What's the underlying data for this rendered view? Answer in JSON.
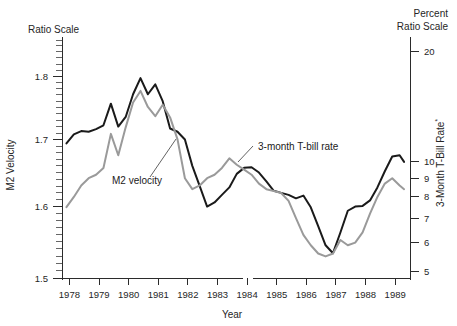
{
  "figure": {
    "top_left_label": "Ratio Scale",
    "top_right_label_line1": "Percent",
    "top_right_label_line2": "Ratio Scale",
    "left_axis_title": "M2 Velocity",
    "right_axis_title": "3-Month T-Bill Rate",
    "right_axis_title_footnote": "*",
    "x_axis_title": "Year",
    "colors": {
      "m2_velocity": "#1a1a1a",
      "tbill_rate": "#9a9a9a",
      "axis": "#2b2b2b",
      "background": "#ffffff"
    }
  },
  "annotations": [
    {
      "label": "M2 velocity",
      "x": 112,
      "y": 184
    },
    {
      "label": "3-month T-bill rate",
      "x": 258,
      "y": 150
    }
  ],
  "chart_data": {
    "type": "line",
    "title": "",
    "subtitle": "",
    "xlabel": "Year",
    "ylabel": "M2 Velocity",
    "y2label": "3-Month T-Bill Rate",
    "grid": false,
    "legend": "inline-annotations",
    "xlim": [
      1977.75,
      1989.5
    ],
    "ylim": [
      1.5,
      1.86
    ],
    "y2lim": [
      4.8,
      21.5
    ],
    "yscale": "log-ratio",
    "y2scale": "log-ratio",
    "xticks": [
      1978,
      1979,
      1980,
      1981,
      1982,
      1983,
      1984,
      1985,
      1986,
      1987,
      1988,
      1989
    ],
    "xticklabels": [
      "1978",
      "1979",
      "1980",
      "1981",
      "1982",
      "1983",
      "1984",
      "1985",
      "1986",
      "1987",
      "1988",
      "1989"
    ],
    "yticks": [
      1.5,
      1.6,
      1.7,
      1.8
    ],
    "yticklabels": [
      "1.5",
      "1.6",
      "1.7",
      "1.8"
    ],
    "y2ticks": [
      5,
      6,
      7,
      8,
      9,
      10,
      20
    ],
    "y2ticklabels": [
      "5",
      "6",
      "7",
      "8",
      "9",
      "10",
      "20"
    ],
    "series": [
      {
        "name": "M2 velocity",
        "axis": "left",
        "color": "#1a1a1a",
        "width": 2.0,
        "x": [
          1977.9,
          1978.15,
          1978.4,
          1978.65,
          1978.9,
          1979.15,
          1979.4,
          1979.65,
          1979.9,
          1980.15,
          1980.4,
          1980.65,
          1980.9,
          1981.15,
          1981.4,
          1981.65,
          1981.9,
          1982.15,
          1982.4,
          1982.65,
          1982.9,
          1983.15,
          1983.4,
          1983.65,
          1983.9,
          1984.15,
          1984.4,
          1984.65,
          1984.9,
          1985.15,
          1985.4,
          1985.65,
          1985.9,
          1986.15,
          1986.4,
          1986.65,
          1986.9,
          1987.15,
          1987.4,
          1987.65,
          1987.9,
          1988.15,
          1988.4,
          1988.65,
          1988.9,
          1989.15,
          1989.3
        ],
        "values": [
          1.694,
          1.708,
          1.713,
          1.712,
          1.716,
          1.722,
          1.756,
          1.72,
          1.735,
          1.771,
          1.797,
          1.771,
          1.787,
          1.76,
          1.717,
          1.712,
          1.7,
          1.66,
          1.63,
          1.6,
          1.606,
          1.617,
          1.628,
          1.648,
          1.657,
          1.658,
          1.65,
          1.637,
          1.623,
          1.62,
          1.617,
          1.612,
          1.616,
          1.599,
          1.572,
          1.545,
          1.534,
          1.563,
          1.594,
          1.6,
          1.601,
          1.609,
          1.628,
          1.652,
          1.674,
          1.676,
          1.666
        ]
      },
      {
        "name": "3-month T-bill rate",
        "axis": "right",
        "color": "#9a9a9a",
        "width": 2.0,
        "x": [
          1977.9,
          1978.15,
          1978.4,
          1978.65,
          1978.9,
          1979.15,
          1979.4,
          1979.65,
          1979.9,
          1980.15,
          1980.4,
          1980.65,
          1980.9,
          1981.15,
          1981.4,
          1981.65,
          1981.9,
          1982.15,
          1982.4,
          1982.65,
          1982.9,
          1983.15,
          1983.4,
          1983.65,
          1983.9,
          1984.15,
          1984.4,
          1984.65,
          1984.9,
          1985.15,
          1985.4,
          1985.65,
          1985.9,
          1986.15,
          1986.4,
          1986.65,
          1986.9,
          1987.15,
          1987.4,
          1987.65,
          1987.9,
          1988.15,
          1988.4,
          1988.65,
          1988.9,
          1989.15,
          1989.3
        ],
        "values": [
          7.5,
          8.0,
          8.6,
          9.0,
          9.2,
          9.6,
          11.9,
          10.4,
          12.4,
          14.5,
          15.6,
          14.1,
          13.3,
          14.3,
          13.2,
          11.5,
          9.0,
          8.4,
          8.6,
          9.0,
          9.2,
          9.6,
          10.2,
          9.8,
          9.5,
          9.2,
          8.7,
          8.4,
          8.3,
          8.2,
          7.8,
          7.0,
          6.3,
          5.9,
          5.6,
          5.5,
          5.6,
          6.1,
          5.9,
          6.0,
          6.4,
          7.2,
          8.0,
          8.7,
          9.0,
          8.6,
          8.4
        ]
      }
    ]
  }
}
